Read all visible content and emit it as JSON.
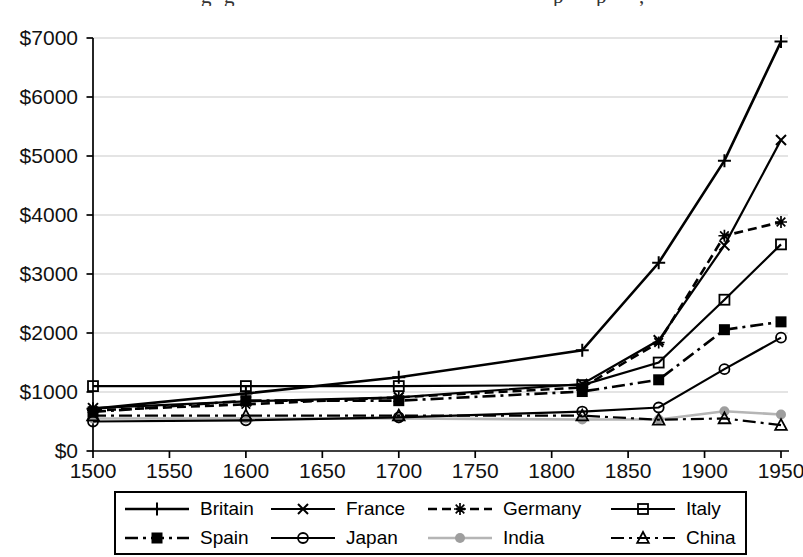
{
  "cropped_title": {
    "note": "title line cut off at top edge; only letter descenders visible",
    "fragments": [
      "g",
      "g",
      "p",
      "p",
      ","
    ]
  },
  "colors": {
    "background": "#ffffff",
    "axis": "#000000",
    "grid": "#c9c9c9",
    "text": "#111111",
    "india_line": "#b5b5b5",
    "india_marker": "#9e9e9e"
  },
  "chart_data": {
    "type": "line",
    "title": "",
    "xlabel": "",
    "ylabel": "",
    "x_years": [
      1500,
      1600,
      1700,
      1820,
      1870,
      1913,
      1950
    ],
    "series": [
      {
        "name": "Britain",
        "marker": "plus",
        "line_style": "solid",
        "color": "#000000",
        "width": 2.6,
        "values": [
          714,
          974,
          1250,
          1706,
          3190,
          4921,
          6939
        ]
      },
      {
        "name": "France",
        "marker": "x",
        "line_style": "solid",
        "color": "#000000",
        "width": 2.2,
        "values": [
          727,
          841,
          910,
          1135,
          1876,
          3485,
          5270
        ]
      },
      {
        "name": "Germany",
        "marker": "asterisk",
        "line_style": "dashed",
        "color": "#000000",
        "width": 2.6,
        "values": [
          688,
          791,
          910,
          1077,
          1839,
          3648,
          3881
        ]
      },
      {
        "name": "Italy",
        "marker": "square-open",
        "line_style": "solid",
        "color": "#000000",
        "width": 2.2,
        "values": [
          1100,
          1100,
          1100,
          1117,
          1499,
          2564,
          3502
        ]
      },
      {
        "name": "Spain",
        "marker": "square-filled",
        "line_style": "dash-dot",
        "color": "#000000",
        "width": 2.6,
        "values": [
          661,
          853,
          853,
          1008,
          1207,
          2056,
          2189
        ]
      },
      {
        "name": "Japan",
        "marker": "circle-open",
        "line_style": "solid",
        "color": "#000000",
        "width": 2.2,
        "values": [
          500,
          520,
          570,
          669,
          737,
          1387,
          1921
        ]
      },
      {
        "name": "India",
        "marker": "circle-filled",
        "line_style": "solid",
        "color": "#b5b5b5",
        "marker_color": "#9e9e9e",
        "width": 2.6,
        "values": [
          550,
          550,
          550,
          533,
          533,
          673,
          619
        ]
      },
      {
        "name": "China",
        "marker": "triangle-open",
        "line_style": "dash-dot",
        "color": "#000000",
        "width": 2.2,
        "values": [
          600,
          600,
          600,
          600,
          530,
          552,
          439
        ]
      }
    ],
    "z_order": [
      6,
      7,
      5,
      4,
      3,
      2,
      1,
      0
    ],
    "x_axis": {
      "range": [
        1500,
        1950
      ],
      "tick_step": 50,
      "tick_labels": [
        "1500",
        "1550",
        "1600",
        "1650",
        "1700",
        "1750",
        "1800",
        "1850",
        "1900",
        "1950"
      ]
    },
    "y_axis": {
      "range": [
        0,
        7000
      ],
      "tick_step": 1000,
      "tick_labels": [
        "$0",
        "$1000",
        "$2000",
        "$3000",
        "$4000",
        "$5000",
        "$6000",
        "$7000"
      ]
    },
    "grid": "horizontal-light",
    "legend": {
      "position": "bottom-box",
      "rows": 2,
      "labels": [
        "Britain",
        "France",
        "Germany",
        "Italy",
        "Spain",
        "Japan",
        "India",
        "China"
      ]
    }
  }
}
